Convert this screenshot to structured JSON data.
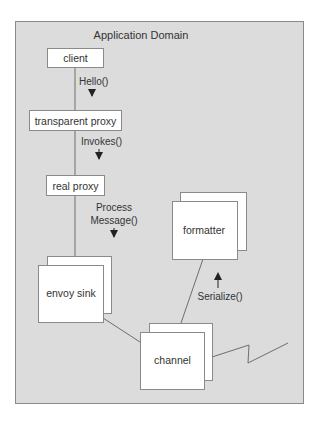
{
  "diagram": {
    "title": "Application Domain",
    "colors": {
      "background": "#ffffff",
      "domain_fill": "#dcdcdc",
      "domain_stroke": "#8a8a8a",
      "box_fill": "#ffffff",
      "box_stroke": "#8a8a8a",
      "line": "#6e6e6e",
      "arrow": "#222222",
      "text": "#333333"
    },
    "nodes": [
      {
        "id": "client",
        "label": "client"
      },
      {
        "id": "transparent-proxy",
        "label": "transparent proxy"
      },
      {
        "id": "real-proxy",
        "label": "real proxy"
      },
      {
        "id": "envoy-sink",
        "label": "envoy sink",
        "stacked": true
      },
      {
        "id": "formatter",
        "label": "formatter",
        "stacked": true
      },
      {
        "id": "channel",
        "label": "channel",
        "stacked": true
      }
    ],
    "edges": [
      {
        "from": "client",
        "to": "transparent-proxy",
        "label": "Hello()",
        "direction": "down"
      },
      {
        "from": "transparent-proxy",
        "to": "real-proxy",
        "label": "Invokes()",
        "direction": "down"
      },
      {
        "from": "real-proxy",
        "to": "envoy-sink",
        "label_lines": [
          "Process",
          "Message()"
        ],
        "direction": "down"
      },
      {
        "from": "envoy-sink",
        "to": "channel",
        "label": ""
      },
      {
        "from": "channel",
        "to": "formatter",
        "label": "Serialize()",
        "direction": "up"
      },
      {
        "from": "channel",
        "to": "network",
        "label": "",
        "style": "zigzag"
      }
    ]
  }
}
